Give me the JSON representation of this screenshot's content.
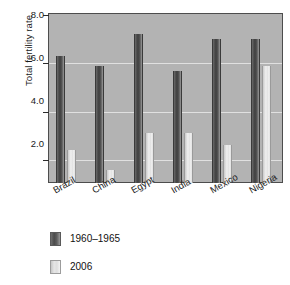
{
  "chart_data": {
    "type": "bar",
    "title": "",
    "xlabel": "",
    "ylabel": "Total fertility rate",
    "ylim": [
      1.0,
      8.0
    ],
    "yticks": [
      "2.0",
      "4.0",
      "6.0",
      "8.0"
    ],
    "ytick_values": [
      2.0,
      4.0,
      6.0,
      8.0
    ],
    "grid": true,
    "legend_position": "below-left",
    "categories": [
      "Brazil",
      "China",
      "Egypt",
      "India",
      "Mexico",
      "Nigeria"
    ],
    "series": [
      {
        "name": "1960–1965",
        "color": "#4a4a4a",
        "values": [
          6.3,
          5.9,
          7.2,
          5.7,
          7.0,
          7.0
        ]
      },
      {
        "name": "2006",
        "color": "#dcdcdc",
        "values": [
          2.4,
          1.6,
          3.1,
          3.1,
          2.6,
          5.9
        ]
      }
    ]
  },
  "axis": {
    "y_title": "Total fertility rate",
    "tick_labels": [
      "8.0",
      "6.0",
      "4.0",
      "2.0"
    ]
  },
  "legend": {
    "items": [
      {
        "label": "1960–1965"
      },
      {
        "label": "2006"
      }
    ]
  },
  "colors": {
    "plot_background": "#b3b3b3",
    "frame": "#4d4d4d",
    "gridline": "#e8e8e8",
    "series1": "#4a4a4a",
    "series2": "#dcdcdc",
    "text": "#1a1a1a"
  }
}
